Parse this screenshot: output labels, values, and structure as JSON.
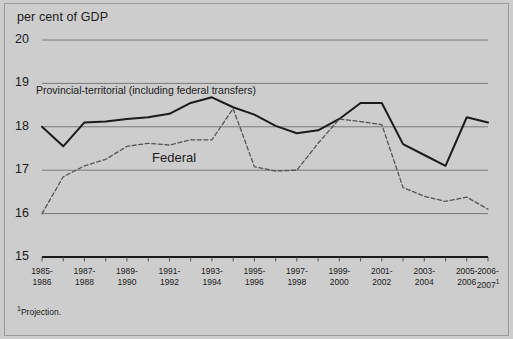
{
  "figure": {
    "axis_title": "per cent of GDP",
    "footnote_marker": "1",
    "footnote_text": "Projection.",
    "background_color": "#cdcdcd",
    "line_color": "#1b1b1b",
    "gridline_color": "#6f6f6f"
  },
  "labels": {
    "provincial": "Provincial-territorial (including federal transfers)",
    "federal": "Federal"
  },
  "chart_data": {
    "type": "line",
    "title": "",
    "subtitle": "",
    "xlabel": "",
    "ylabel": "per cent of GDP",
    "ylim": [
      15,
      20
    ],
    "yticks": [
      20,
      19,
      18,
      17,
      16,
      15
    ],
    "ytick_labels": [
      "20",
      "19",
      "18",
      "17",
      "16",
      "15"
    ],
    "grid": true,
    "legend_position": "inline-annotations",
    "categories": [
      "1985-1986",
      "1986-1987",
      "1987-1988",
      "1988-1989",
      "1989-1990",
      "1990-1991",
      "1991-1992",
      "1992-1993",
      "1993-1994",
      "1994-1995",
      "1995-1996",
      "1996-1997",
      "1997-1998",
      "1998-1999",
      "1999-2000",
      "2000-2001",
      "2001-2002",
      "2002-2003",
      "2003-2004",
      "2004-2005",
      "2005-2006",
      "2006-2007"
    ],
    "xtick_labels": [
      [
        "1985-",
        "1986"
      ],
      [
        "1987-",
        "1988"
      ],
      [
        "1989-",
        "1990"
      ],
      [
        "1991-",
        "1992"
      ],
      [
        "1993-",
        "1994"
      ],
      [
        "1995-",
        "1996"
      ],
      [
        "1997-",
        "1998"
      ],
      [
        "1999-",
        "2000"
      ],
      [
        "2001-",
        "2002"
      ],
      [
        "2003-",
        "2004"
      ],
      [
        "2005-",
        "2006"
      ],
      [
        "2006-",
        "2007"
      ]
    ],
    "xtick_labeled_indices": [
      0,
      2,
      4,
      6,
      8,
      10,
      12,
      14,
      16,
      18,
      20,
      21
    ],
    "series": [
      {
        "name": "Provincial-territorial (including federal transfers)",
        "style": "solid",
        "color": "#1b1b1b",
        "values": [
          18.0,
          17.55,
          18.1,
          18.12,
          18.18,
          18.22,
          18.3,
          18.55,
          18.68,
          18.45,
          18.28,
          18.02,
          17.85,
          17.92,
          18.18,
          18.55,
          18.55,
          17.6,
          17.35,
          17.1,
          18.22,
          18.1
        ]
      },
      {
        "name": "Federal",
        "style": "dashed",
        "color": "#555555",
        "values": [
          16.0,
          16.85,
          17.1,
          17.25,
          17.55,
          17.62,
          17.58,
          17.7,
          17.7,
          18.42,
          17.08,
          16.98,
          17.0,
          17.62,
          18.18,
          18.12,
          18.05,
          16.6,
          16.4,
          16.28,
          16.38,
          16.1
        ]
      }
    ],
    "annotations": [
      {
        "text": "Provincial-territorial (including federal transfers)",
        "series": "Provincial-territorial (including federal transfers)"
      },
      {
        "text": "Federal",
        "series": "Federal"
      }
    ]
  }
}
